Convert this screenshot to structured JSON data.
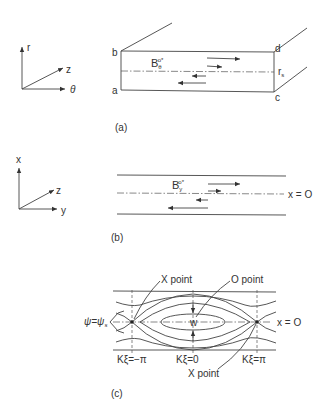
{
  "figure": {
    "panel_a": {
      "caption": "(a)",
      "axes": {
        "up": "r",
        "diag": "z",
        "right": "θ"
      },
      "corners": {
        "b": "b",
        "a": "a",
        "d": "d",
        "c": "c"
      },
      "field_label": "B",
      "field_sub": "θ",
      "field_sup": "o*",
      "midline_label": "r",
      "midline_sub": "s"
    },
    "panel_b": {
      "caption": "(b)",
      "axes": {
        "up": "x",
        "diag": "z",
        "right": "y"
      },
      "field_label": "B",
      "field_sub": "y",
      "field_sup": "o*",
      "midline_label": "x = O"
    },
    "panel_c": {
      "caption": "(c)",
      "x_point_top": "X point",
      "o_point": "O point",
      "x_point_bottom": "X point",
      "width_label": "w",
      "psi_label": "ψ=ψ",
      "psi_sub": "s",
      "midline_label": "x = O",
      "ticks": [
        "Kξ=−π",
        "Kξ=0",
        "Kξ=π"
      ]
    }
  }
}
